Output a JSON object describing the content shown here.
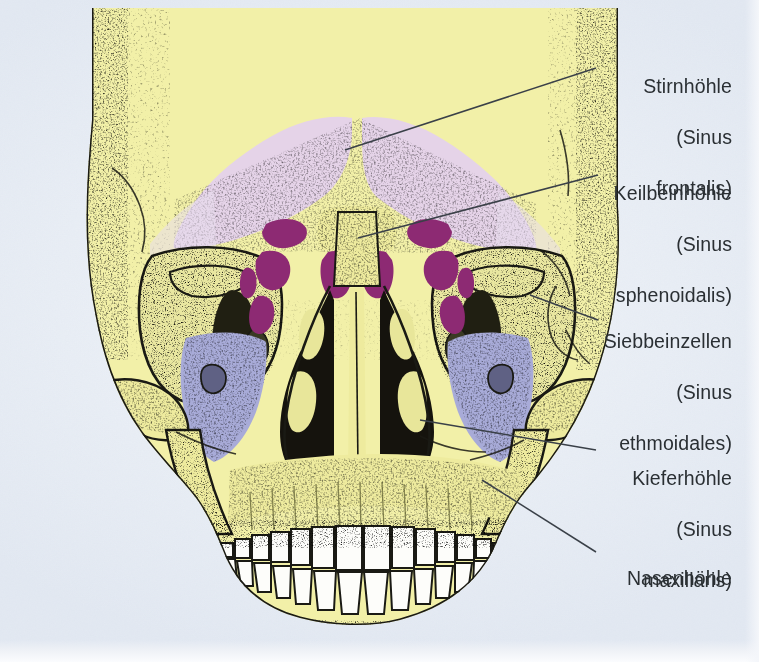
{
  "figure": {
    "view": "anterior",
    "background_color": "#e9eef5",
    "bone_color": "#f2f0a8",
    "outline_color": "#1a1a14",
    "tooth_color": "#fdfdfa",
    "nasal_cavity_color": "#15130d"
  },
  "legend_colors": {
    "frontal_sinus": "#e5d3e8",
    "sphenoid_sinus": "#8d2a73",
    "ethmoid_cells": "#8d2a73",
    "maxillary_sinus": "#a8abd8",
    "label_text": "#2a2f33",
    "leader_line": "#3a4048"
  },
  "labels": [
    {
      "id": "stirnhoehle",
      "name": "Stirnhöhle",
      "latin_open": "(Sinus",
      "latin_close": "frontalis)",
      "lines": [
        "Stirnhöhle",
        "(Sinus",
        "frontalis)"
      ],
      "structure": "frontal-sinus"
    },
    {
      "id": "keilbeinhoehle",
      "name": "Keilbeinhöhle",
      "latin_open": "(Sinus",
      "latin_close": "sphenoidalis)",
      "lines": [
        "Keilbeinhöhle",
        "(Sinus",
        "sphenoidalis)"
      ],
      "structure": "sphenoid-sinus"
    },
    {
      "id": "siebbeinzellen",
      "name": "Siebbeinzellen",
      "latin_open": "(Sinus",
      "latin_close": "ethmoidales)",
      "lines": [
        "Siebbeinzellen",
        "(Sinus",
        "ethmoidales)"
      ],
      "structure": "ethmoid-cells"
    },
    {
      "id": "kieferhoehle",
      "name": "Kieferhöhle",
      "latin_open": "(Sinus",
      "latin_close": "maxillaris)",
      "lines": [
        "Kieferhöhle",
        "(Sinus",
        "maxillaris)"
      ],
      "structure": "maxillary-sinus"
    },
    {
      "id": "nasenhoehle",
      "name": "Nasenhöhle",
      "latin_open": "",
      "latin_close": "",
      "lines": [
        "Nasenhöhle"
      ],
      "structure": "nasal-cavity"
    }
  ]
}
